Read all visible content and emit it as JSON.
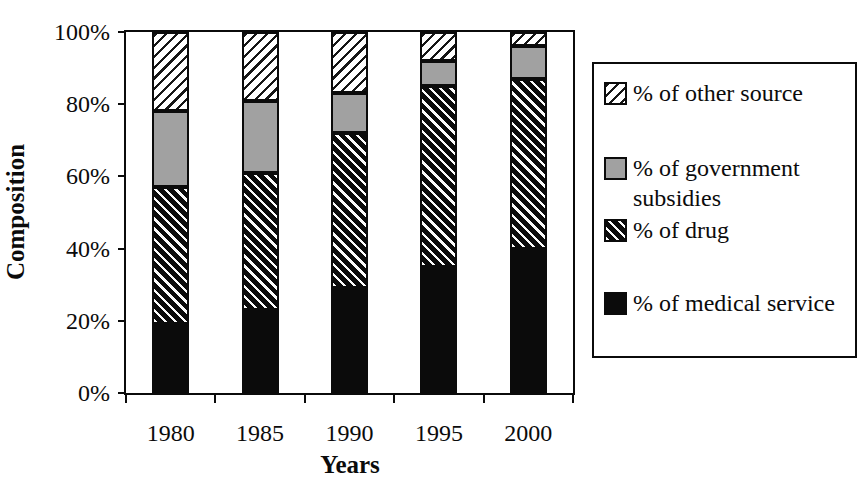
{
  "chart_data": {
    "type": "bar",
    "stacked": true,
    "title": "",
    "xlabel": "Years",
    "ylabel": "Composition",
    "categories": [
      "1980",
      "1985",
      "1990",
      "1995",
      "2000"
    ],
    "series": [
      {
        "name": "% of medical service",
        "pattern": "solid-black",
        "values": [
          19,
          23,
          29,
          35,
          40
        ]
      },
      {
        "name": "% of drug",
        "pattern": "black-diagonal-hatch",
        "values": [
          38,
          38,
          43,
          50,
          47
        ]
      },
      {
        "name": "% of government subsidies",
        "pattern": "gray-solid",
        "values": [
          21,
          20,
          11,
          7,
          9
        ]
      },
      {
        "name": "% of other source",
        "pattern": "light-diagonal-hatch",
        "values": [
          22,
          19,
          17,
          8,
          4
        ]
      }
    ],
    "ylim": [
      0,
      100
    ],
    "ytick_labels": [
      "0%",
      "20%",
      "40%",
      "60%",
      "80%",
      "100%"
    ],
    "ytick_values": [
      0,
      20,
      40,
      60,
      80,
      100
    ],
    "grid": "off",
    "legend_position": "right",
    "legend_entries": [
      {
        "label": "% of other source",
        "swatch": "light-diagonal-hatch"
      },
      {
        "label": "% of government subsidies",
        "swatch": "gray-solid"
      },
      {
        "label": "% of drug",
        "swatch": "black-diagonal-hatch"
      },
      {
        "label": "% of medical service",
        "swatch": "solid-black"
      }
    ]
  },
  "colors": {
    "ink": "#0b0b0b",
    "gray_fill": "#a1a1a1",
    "background": "#ffffff"
  }
}
